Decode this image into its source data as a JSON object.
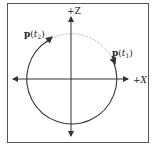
{
  "diagram": {
    "axes": {
      "z_label": "+Z",
      "x_label": "+X"
    },
    "points": {
      "p1": {
        "bold": "p",
        "open": "(",
        "var": "t",
        "sub": "1",
        "close": ")"
      },
      "p2": {
        "bold": "p",
        "open": "(",
        "var": "t",
        "sub": "2",
        "close": ")"
      }
    },
    "colors": {
      "stroke": "#333333",
      "dashed": "#999999",
      "frame": "#555555"
    }
  }
}
